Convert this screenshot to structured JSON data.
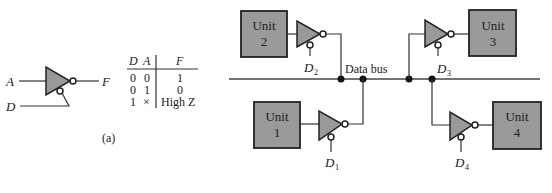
{
  "figure_a": {
    "caption": "(a)",
    "gate": {
      "type": "tri-state inverting buffer (active-low enable)",
      "input_label": "A",
      "enable_label": "D",
      "output_label": "F"
    },
    "truth_table": {
      "headers": [
        "D",
        "A",
        "F"
      ],
      "rows": [
        [
          "0",
          "0",
          "1"
        ],
        [
          "0",
          "1",
          "0"
        ],
        [
          "1",
          "×",
          "High Z"
        ]
      ]
    }
  },
  "figure_b": {
    "bus_label": "Data bus",
    "units": [
      {
        "name": "Unit",
        "number": "2",
        "enable": "D",
        "enable_sub": "2"
      },
      {
        "name": "Unit",
        "number": "3",
        "enable": "D",
        "enable_sub": "3"
      },
      {
        "name": "Unit",
        "number": "1",
        "enable": "D",
        "enable_sub": "1"
      },
      {
        "name": "Unit",
        "number": "4",
        "enable": "D",
        "enable_sub": "4"
      }
    ]
  },
  "colors": {
    "gate_fill": "#999999",
    "unit_fill": "#9a9a9a",
    "line": "#333333"
  }
}
